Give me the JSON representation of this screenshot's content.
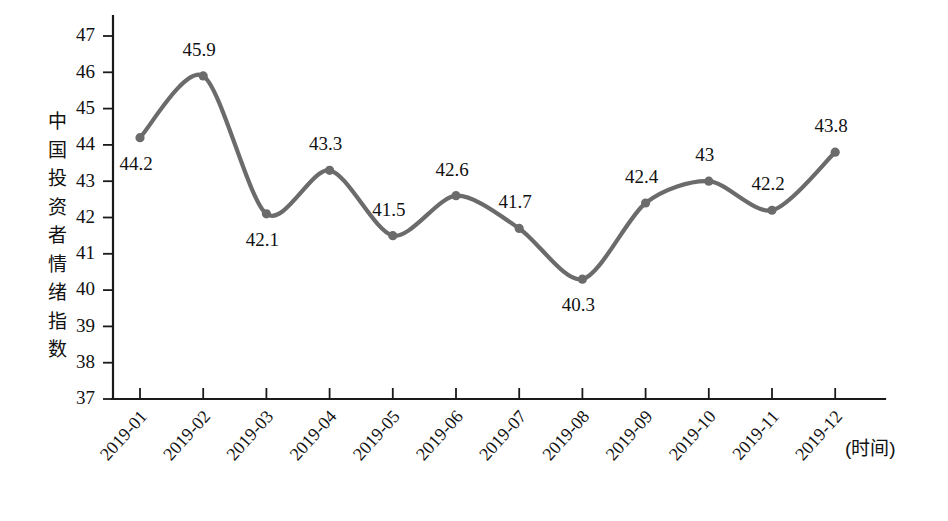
{
  "chart_data": {
    "type": "line",
    "title": "",
    "subtitle": "",
    "xlabel": "(时间)",
    "ylabel": "中国投资者情绪指数",
    "categories": [
      "2019-01",
      "2019-02",
      "2019-03",
      "2019-04",
      "2019-05",
      "2019-06",
      "2019-07",
      "2019-08",
      "2019-09",
      "2019-10",
      "2019-11",
      "2019-12"
    ],
    "values": [
      44.2,
      45.9,
      42.1,
      43.3,
      41.5,
      42.6,
      41.7,
      40.3,
      42.4,
      43,
      42.2,
      43.8
    ],
    "point_labels": [
      "44.2",
      "45.9",
      "42.1",
      "43.3",
      "41.5",
      "42.6",
      "41.7",
      "40.3",
      "42.4",
      "43",
      "42.2",
      "43.8"
    ],
    "label_positions": [
      "below",
      "above",
      "below",
      "above",
      "above",
      "above",
      "above",
      "below",
      "above",
      "above",
      "above",
      "above"
    ],
    "ylim": [
      37,
      47
    ],
    "yticks": [
      37,
      38,
      39,
      40,
      41,
      42,
      43,
      44,
      45,
      46,
      47
    ],
    "ytick_labels": [
      "37",
      "38",
      "39",
      "40",
      "41",
      "42",
      "43",
      "44",
      "45",
      "46",
      "47"
    ],
    "grid": false,
    "legend": false,
    "legend_position": "none",
    "series_color": "#6b6b6b",
    "axis_color": "#1a1a1a",
    "background_color": "#ffffff",
    "marker": "circle",
    "line_style": "smooth"
  },
  "ylabel_chars": [
    "中",
    "国",
    "投",
    "资",
    "者",
    "情",
    "绪",
    "指",
    "数"
  ],
  "axis": {
    "x_caption": "(时间)"
  }
}
